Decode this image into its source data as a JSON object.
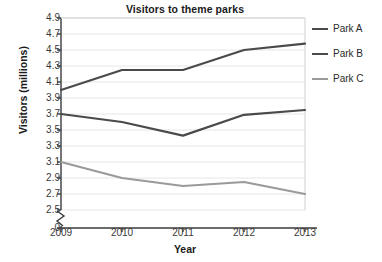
{
  "chart_data": {
    "type": "line",
    "title": "Visitors to theme parks",
    "xlabel": "Year",
    "ylabel": "Visitors (millions)",
    "categories": [
      "2009",
      "2010",
      "2011",
      "2012",
      "2013"
    ],
    "x": [
      2009,
      2010,
      2011,
      2012,
      2013
    ],
    "series": [
      {
        "name": "Park A",
        "values": [
          4.0,
          4.25,
          4.25,
          4.5,
          4.58
        ],
        "color": "#4a4a4a"
      },
      {
        "name": "Park B",
        "values": [
          3.7,
          3.6,
          3.43,
          3.69,
          3.75
        ],
        "color": "#4a4a4a"
      },
      {
        "name": "Park C",
        "values": [
          3.1,
          2.9,
          2.8,
          2.85,
          2.7
        ],
        "color": "#9a9a9a"
      }
    ],
    "ylim": [
      2.5,
      4.9
    ],
    "yticks": [
      "4.9",
      "4.7",
      "4.5",
      "4.3",
      "4.1",
      "3.9",
      "3.7",
      "3.5",
      "3.3",
      "3.1",
      "2.9",
      "2.7",
      "2.5",
      "0"
    ],
    "ytick_values": [
      4.9,
      4.7,
      4.5,
      4.3,
      4.1,
      3.9,
      3.7,
      3.5,
      3.3,
      3.1,
      2.9,
      2.7,
      2.5,
      0
    ],
    "xticks": [
      "2009",
      "2010",
      "2011",
      "2012",
      "2013"
    ],
    "grid": true,
    "grid_color": "#e6e6e6",
    "axis_color": "#3a3a3a",
    "axis_break": true,
    "legend_position": "right",
    "legend": [
      "Park A",
      "Park B",
      "Park C"
    ]
  },
  "legend": {
    "entries": [
      {
        "label": "Park A"
      },
      {
        "label": "Park B"
      },
      {
        "label": "Park C"
      }
    ]
  }
}
